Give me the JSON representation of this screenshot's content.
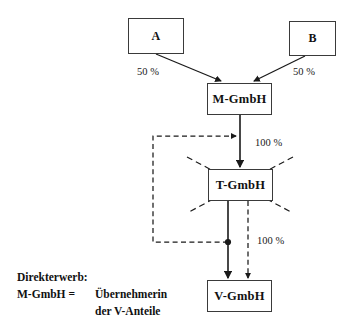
{
  "diagram": {
    "type": "corporate-structure-diagram",
    "language": "de",
    "nodes": [
      {
        "id": "A",
        "label": "A",
        "x": 128,
        "y": 18,
        "w": 56,
        "h": 36
      },
      {
        "id": "B",
        "label": "B",
        "x": 289,
        "y": 21,
        "w": 47,
        "h": 35
      },
      {
        "id": "M",
        "label": "M-GmbH",
        "x": 207,
        "y": 83,
        "w": 65,
        "h": 32
      },
      {
        "id": "T",
        "label": "T-GmbH",
        "x": 208,
        "y": 169,
        "w": 65,
        "h": 32,
        "crossed_out": true
      },
      {
        "id": "V",
        "label": "V-GmbH",
        "x": 207,
        "y": 280,
        "w": 65,
        "h": 32
      }
    ],
    "edge_labels": [
      {
        "id": "a-to-m",
        "text": "50 %",
        "x": 137,
        "y": 66
      },
      {
        "id": "b-to-m",
        "text": "50 %",
        "x": 293,
        "y": 66
      },
      {
        "id": "m-to-t",
        "text": "100 %",
        "x": 255,
        "y": 137
      },
      {
        "id": "t-to-v",
        "text": "100 %",
        "x": 257,
        "y": 235
      }
    ],
    "legend": {
      "line1": "Direkterwerb:",
      "line2": "M-GmbH =",
      "line3": "Übernehmerin",
      "line4": "der V-Anteile"
    },
    "colors": {
      "stroke": "#3a3a3a",
      "line": "#1a1a1a",
      "text": "#111111",
      "background": "#ffffff"
    }
  }
}
